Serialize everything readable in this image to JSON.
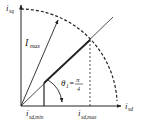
{
  "diagram": {
    "axes": {
      "y_label_main": "i",
      "y_label_sub": "sq",
      "x_label_main": "i",
      "x_label_sub": "sd"
    },
    "labels": {
      "imax_main": "I",
      "imax_sub": "max",
      "theta_main": "θ",
      "theta_sub": "1",
      "theta_eq": "=",
      "theta_num": "π",
      "theta_den": "4",
      "isd_min_main": "i",
      "isd_min_sub": "sd,min",
      "isd_max_main": "i",
      "isd_max_sub": "sd,max"
    },
    "colors": {
      "line": "#222222",
      "background": "#ffffff"
    }
  }
}
